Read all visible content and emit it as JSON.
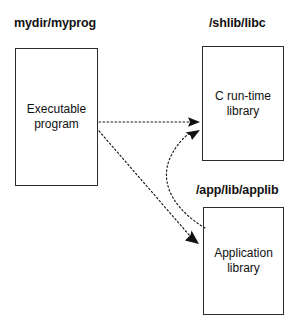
{
  "diagram": {
    "type": "block-diagram",
    "background_color": "#ffffff",
    "line_color": "#1a1a1a",
    "text_color": "#111111",
    "labels": {
      "program_path": "mydir/myprog",
      "libc_path": "/shlib/libc",
      "applib_path": "/app/lib/applib"
    },
    "nodes": [
      {
        "id": "executable",
        "label": "Executable\nprogram",
        "path_label": "mydir/myprog"
      },
      {
        "id": "c-runtime",
        "label": "C run-time\nlibrary",
        "path_label": "/shlib/libc"
      },
      {
        "id": "application-library",
        "label": "Application\nlibrary",
        "path_label": "/app/lib/applib"
      }
    ],
    "edges": [
      {
        "id": "exec-to-libc",
        "from": "executable",
        "to": "c-runtime",
        "style": "dotted",
        "arrow": "single"
      },
      {
        "id": "exec-to-applib",
        "from": "executable",
        "to": "application-library",
        "style": "dotted",
        "arrow": "single"
      },
      {
        "id": "applib-to-libc",
        "from": "application-library",
        "to": "c-runtime",
        "style": "dotted-curved",
        "arrow": "single"
      }
    ]
  }
}
